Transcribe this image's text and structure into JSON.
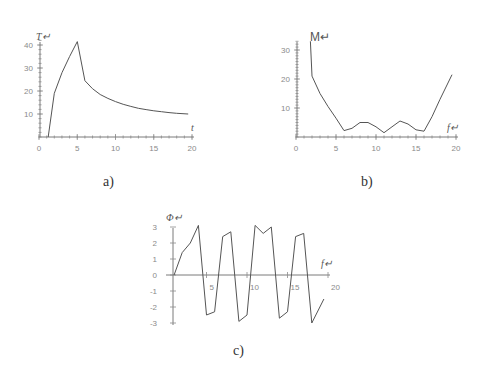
{
  "captions": {
    "a": "a)",
    "b": "b)",
    "c": "c)"
  },
  "chart_data": [
    {
      "id": "a",
      "type": "line",
      "title": "",
      "xlabel": "t",
      "ylabel": "T",
      "xlim": [
        0,
        20
      ],
      "ylim": [
        0,
        42
      ],
      "xticks": [
        0,
        5,
        10,
        15,
        20
      ],
      "yticks": [
        10,
        20,
        30,
        40
      ],
      "grid": false,
      "x": [
        1.2,
        2,
        3,
        4,
        5,
        6,
        7,
        8,
        9,
        10,
        11,
        12,
        13,
        14,
        15,
        16,
        17,
        18,
        19.5
      ],
      "y": [
        0,
        19,
        28,
        35,
        41.5,
        24.5,
        21,
        18.5,
        16.8,
        15.4,
        14.2,
        13.3,
        12.5,
        11.9,
        11.4,
        11.0,
        10.6,
        10.3,
        10.0
      ]
    },
    {
      "id": "b",
      "type": "line",
      "title": "",
      "xlabel": "f",
      "ylabel": "M",
      "xlim": [
        0,
        20
      ],
      "ylim": [
        0,
        33
      ],
      "xticks": [
        0,
        5,
        10,
        15,
        20
      ],
      "yticks": [
        10,
        20,
        30
      ],
      "grid": false,
      "x": [
        1.8,
        2,
        3,
        4,
        5,
        6,
        7,
        8,
        9,
        10,
        11,
        12,
        13,
        14,
        15,
        16,
        17,
        18,
        19.5
      ],
      "y": [
        33,
        21,
        15,
        10.5,
        6.5,
        2.2,
        3,
        5,
        5,
        3.5,
        1.5,
        3.5,
        5.5,
        4.5,
        2.5,
        2,
        7,
        13,
        21.5
      ]
    },
    {
      "id": "c",
      "type": "line",
      "title": "",
      "xlabel": "f",
      "ylabel": "Φ",
      "xlim": [
        0,
        20
      ],
      "ylim": [
        -3,
        3
      ],
      "xticks": [
        5,
        10,
        15,
        20
      ],
      "yticks": [
        -3,
        -2,
        -1,
        0,
        1,
        2,
        3
      ],
      "grid": false,
      "x": [
        1,
        2,
        3,
        4,
        5,
        6,
        7,
        8,
        9,
        10,
        11,
        12,
        13,
        14,
        15,
        16,
        17,
        18,
        19.5
      ],
      "y": [
        0,
        1.4,
        2.0,
        3.1,
        -2.5,
        -2.3,
        2.4,
        2.7,
        -2.9,
        -2.5,
        3.1,
        2.6,
        3.0,
        -2.7,
        -2.3,
        2.4,
        2.6,
        -3.0,
        -1.5
      ]
    }
  ]
}
